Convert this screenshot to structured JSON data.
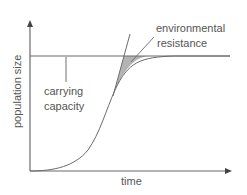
{
  "diagram": {
    "axes": {
      "y_label": "population size",
      "x_label": "time"
    },
    "annotations": {
      "carrying_capacity_line1": "carrying",
      "carrying_capacity_line2": "capacity",
      "environmental_resistance_line1": "environmental",
      "environmental_resistance_line2": "resistance"
    },
    "curves": [
      {
        "name": "logistic-growth",
        "type": "S-curve"
      },
      {
        "name": "exponential-growth",
        "type": "J-curve"
      },
      {
        "name": "carrying-capacity",
        "type": "horizontal-line"
      }
    ],
    "colors": {
      "line": "#6b6b6b",
      "shade": "#b3b3b3",
      "text": "#555555"
    }
  }
}
